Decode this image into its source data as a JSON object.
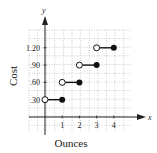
{
  "chart_data": {
    "type": "step",
    "title": "",
    "xlabel": "Ounces",
    "ylabel": "Cost",
    "x_axis_var": "x",
    "y_axis_var": "y",
    "x_ticks": [
      "1",
      "2",
      "3",
      "4"
    ],
    "y_ticks": [
      ".30",
      ".60",
      ".90",
      "1.20"
    ],
    "xlim": [
      -0.9,
      4.9
    ],
    "ylim": [
      -0.45,
      1.75
    ],
    "grid": true,
    "segments": [
      {
        "x_start": 0,
        "x_end": 1,
        "y": 0.3,
        "start_open": true,
        "end_closed": true
      },
      {
        "x_start": 1,
        "x_end": 2,
        "y": 0.6,
        "start_open": true,
        "end_closed": true
      },
      {
        "x_start": 2,
        "x_end": 3,
        "y": 0.9,
        "start_open": true,
        "end_closed": true
      },
      {
        "x_start": 3,
        "x_end": 4,
        "y": 1.2,
        "start_open": true,
        "end_closed": true
      }
    ]
  },
  "colors": {
    "axis": "#222222",
    "grid": "#9a9a9a",
    "line": "#111111"
  }
}
